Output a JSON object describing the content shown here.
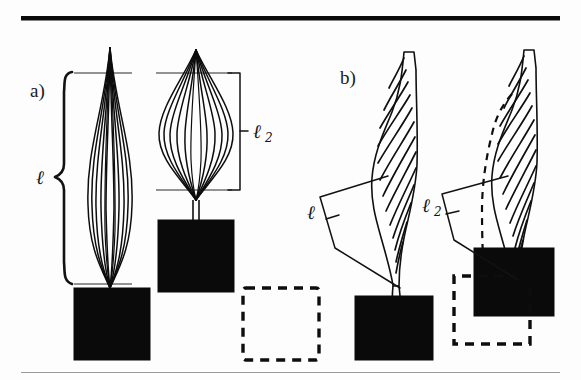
{
  "figure": {
    "caption_rules": {
      "top_rule": "thick-black-horizontal-rule",
      "bottom_rule": "thin-gray-horizontal-rule"
    },
    "panels": [
      {
        "id": "a",
        "label": "a)",
        "description": "fiber bundle buckling: relaxed tall bundle versus compressed bulged bundle",
        "measures": [
          {
            "symbol": "ℓ",
            "subscript": "",
            "name": "length-l",
            "style": "curly-brace",
            "applies_to": "relaxed-bundle"
          },
          {
            "symbol": "ℓ",
            "subscript": "2",
            "name": "length-l2",
            "style": "square-bracket",
            "applies_to": "compressed-bundle"
          }
        ],
        "blocks": [
          {
            "name": "block-solid-left",
            "style": "filled"
          },
          {
            "name": "block-solid-right",
            "style": "filled"
          },
          {
            "name": "block-dashed-right",
            "style": "dashed-outline"
          }
        ]
      },
      {
        "id": "b",
        "label": "b)",
        "description": "hatched curved blade: upright blade versus displaced blade with ghost outline",
        "measures": [
          {
            "symbol": "ℓ",
            "subscript": "",
            "name": "length-l",
            "style": "slanted-bracket",
            "applies_to": "upright-blade"
          },
          {
            "symbol": "ℓ",
            "subscript": "2",
            "name": "length-l2",
            "style": "slanted-bracket",
            "applies_to": "displaced-blade"
          }
        ],
        "blocks": [
          {
            "name": "block-solid-left",
            "style": "filled"
          },
          {
            "name": "block-solid-right",
            "style": "filled"
          },
          {
            "name": "block-dashed-right",
            "style": "dashed-outline"
          }
        ]
      }
    ],
    "labels": {
      "panel_a": "a)",
      "panel_b": "b)",
      "ell": "ℓ",
      "ell2_sub": "2"
    },
    "colors": {
      "ink": "#0d0d0d",
      "paper": "#fdfdfd",
      "rule_bottom": "#9a9a9a"
    }
  }
}
